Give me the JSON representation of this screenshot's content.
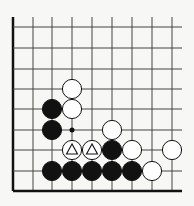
{
  "board": {
    "description": "Go problem diagram, lower-left corner",
    "columns_x": [
      13,
      33,
      52,
      72,
      92,
      112,
      132,
      152,
      172
    ],
    "rows_y": [
      17,
      27,
      48,
      69,
      89,
      109,
      130,
      150,
      171,
      191
    ],
    "line_color": "#444444",
    "edge_color": "#111111",
    "black_color": "#111111",
    "white_fill": "#ffffff",
    "stones": [
      {
        "color": "white",
        "x": 72,
        "y": 89
      },
      {
        "color": "black",
        "x": 52,
        "y": 109
      },
      {
        "color": "white",
        "x": 72,
        "y": 109
      },
      {
        "color": "black",
        "x": 52,
        "y": 130
      },
      {
        "color": "white",
        "x": 112,
        "y": 130
      },
      {
        "color": "white",
        "x": 72,
        "y": 150,
        "mark": "triangle"
      },
      {
        "color": "white",
        "x": 92,
        "y": 150,
        "mark": "triangle"
      },
      {
        "color": "black",
        "x": 112,
        "y": 150
      },
      {
        "color": "white",
        "x": 132,
        "y": 150
      },
      {
        "color": "white",
        "x": 172,
        "y": 150
      },
      {
        "color": "black",
        "x": 52,
        "y": 171
      },
      {
        "color": "black",
        "x": 72,
        "y": 171
      },
      {
        "color": "black",
        "x": 92,
        "y": 171
      },
      {
        "color": "black",
        "x": 112,
        "y": 171
      },
      {
        "color": "black",
        "x": 132,
        "y": 171
      },
      {
        "color": "white",
        "x": 152,
        "y": 171
      }
    ],
    "markers": [
      {
        "type": "dot",
        "x": 72,
        "y": 130
      }
    ]
  }
}
